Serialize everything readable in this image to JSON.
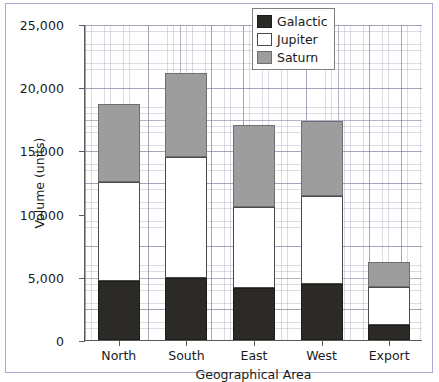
{
  "chart_data": {
    "type": "bar",
    "subtype": "stacked-vertical",
    "title": "",
    "xlabel": "Geographical Area",
    "ylabel": "Volume (units)",
    "categories": [
      "North",
      "South",
      "East",
      "West",
      "Export"
    ],
    "series": [
      {
        "name": "Galactic",
        "color": "#2b2a26",
        "values": [
          4700,
          4900,
          4100,
          4400,
          1200
        ]
      },
      {
        "name": "Jupiter",
        "color": "#ffffff",
        "values": [
          7800,
          9600,
          6400,
          7000,
          3000
        ]
      },
      {
        "name": "Saturn",
        "color": "#9d9d9d",
        "values": [
          6200,
          6600,
          6500,
          5900,
          1950
        ]
      }
    ],
    "totals": [
      18700,
      21100,
      17000,
      17300,
      6150
    ],
    "ylim": [
      0,
      25000
    ],
    "ytick_values": [
      0,
      5000,
      10000,
      15000,
      20000,
      25000
    ],
    "ytick_labels": [
      "0",
      "5,000",
      "10,000",
      "15,000",
      "20,000",
      "25,000"
    ],
    "grid": true,
    "grid_style": "graph-paper-minor-and-major",
    "legend_position": "top-right",
    "legend_entries": [
      "Galactic",
      "Jupiter",
      "Saturn"
    ],
    "frame_border_color": "#a9a8d6",
    "axis_color": "#5a5a5a",
    "grid_color": "#8c8caa"
  }
}
